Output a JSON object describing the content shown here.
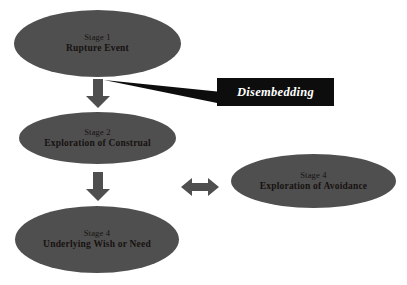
{
  "diagram": {
    "title_text": "Stages of rupture resolution with disembedding callout",
    "background_color": "#ffffff",
    "node_fill_color": "#4f4f4f",
    "node_text_color": "#17120f",
    "callout_fill_color": "#0d0d0d",
    "callout_text_color": "#ffffff",
    "arrow_color": "#4f4f4f"
  },
  "nodes": [
    {
      "id": "rupture-event",
      "stage": "Stage 1",
      "title": "Rupture Event"
    },
    {
      "id": "exploration-of-construal",
      "stage": "Stage 2",
      "title": "Exploration of Construal"
    },
    {
      "id": "underlying-wish-or-need",
      "stage": "Stage 4",
      "title": "Underlying Wish or Need"
    },
    {
      "id": "exploration-of-avoidance",
      "stage": "Stage 4",
      "title": "Exploration of Avoidance"
    }
  ],
  "callout": {
    "label": "Disembedding"
  },
  "connectors": [
    {
      "id": "rupture-to-construal",
      "type": "arrow-down"
    },
    {
      "id": "construal-to-wish",
      "type": "arrow-down"
    },
    {
      "id": "construal-avoidance-link",
      "type": "arrow-bidirectional"
    },
    {
      "id": "disembedding-pointer",
      "type": "leader-line"
    }
  ]
}
